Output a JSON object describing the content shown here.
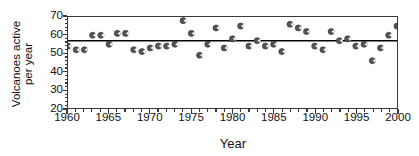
{
  "chart_data": {
    "type": "scatter",
    "title": "",
    "xlabel": "Year",
    "ylabel": "Volcanoes active\nper year",
    "xlim": [
      1960,
      2000
    ],
    "ylim": [
      20,
      70
    ],
    "xticks": [
      1960,
      1965,
      1970,
      1975,
      1980,
      1985,
      1990,
      1995,
      2000
    ],
    "xtick_labels": [
      "1960",
      "1965",
      "1970",
      "1975",
      "1980",
      "1985",
      "1990",
      "1995",
      "2000"
    ],
    "xtick_minor_step": 1,
    "yticks": [
      20,
      30,
      40,
      50,
      60,
      70
    ],
    "ytick_labels": [
      "20",
      "30",
      "40",
      "50",
      "60",
      "70"
    ],
    "ytick_minor_step": 2,
    "grid": false,
    "legend": null,
    "marker": "filled-circle",
    "marker_color": "#555555",
    "reference_line": {
      "type": "horizontal",
      "value": 57,
      "color": "#000000",
      "width": 1.6,
      "label": ""
    },
    "x": [
      1960,
      1961,
      1962,
      1963,
      1964,
      1965,
      1966,
      1967,
      1968,
      1969,
      1970,
      1971,
      1972,
      1973,
      1974,
      1975,
      1976,
      1977,
      1978,
      1979,
      1980,
      1981,
      1982,
      1983,
      1984,
      1985,
      1986,
      1987,
      1988,
      1989,
      1990,
      1991,
      1992,
      1993,
      1994,
      1995,
      1996,
      1997,
      1998,
      1999,
      2000
    ],
    "values": [
      54,
      52,
      52,
      60,
      60,
      55,
      61,
      61,
      52,
      51,
      53,
      54,
      54,
      55,
      68,
      61,
      49,
      55,
      64,
      53,
      58,
      65,
      54,
      57,
      54,
      55,
      51,
      66,
      64,
      62,
      54,
      52,
      62,
      57,
      58,
      54,
      55,
      46,
      53,
      60,
      65
    ],
    "points": [
      {
        "year": 1960,
        "value": 54
      },
      {
        "year": 1961,
        "value": 52
      },
      {
        "year": 1962,
        "value": 52
      },
      {
        "year": 1963,
        "value": 60
      },
      {
        "year": 1964,
        "value": 60
      },
      {
        "year": 1965,
        "value": 55
      },
      {
        "year": 1966,
        "value": 61
      },
      {
        "year": 1967,
        "value": 61
      },
      {
        "year": 1968,
        "value": 52
      },
      {
        "year": 1969,
        "value": 51
      },
      {
        "year": 1970,
        "value": 53
      },
      {
        "year": 1971,
        "value": 54
      },
      {
        "year": 1972,
        "value": 54
      },
      {
        "year": 1973,
        "value": 55
      },
      {
        "year": 1974,
        "value": 68
      },
      {
        "year": 1975,
        "value": 61
      },
      {
        "year": 1976,
        "value": 49
      },
      {
        "year": 1977,
        "value": 55
      },
      {
        "year": 1978,
        "value": 64
      },
      {
        "year": 1979,
        "value": 53
      },
      {
        "year": 1980,
        "value": 58
      },
      {
        "year": 1981,
        "value": 65
      },
      {
        "year": 1982,
        "value": 54
      },
      {
        "year": 1983,
        "value": 57
      },
      {
        "year": 1984,
        "value": 54
      },
      {
        "year": 1985,
        "value": 55
      },
      {
        "year": 1986,
        "value": 51
      },
      {
        "year": 1987,
        "value": 66
      },
      {
        "year": 1988,
        "value": 64
      },
      {
        "year": 1989,
        "value": 62
      },
      {
        "year": 1990,
        "value": 54
      },
      {
        "year": 1991,
        "value": 52
      },
      {
        "year": 1992,
        "value": 62
      },
      {
        "year": 1993,
        "value": 57
      },
      {
        "year": 1994,
        "value": 58
      },
      {
        "year": 1995,
        "value": 54
      },
      {
        "year": 1996,
        "value": 55
      },
      {
        "year": 1997,
        "value": 46
      },
      {
        "year": 1998,
        "value": 53
      },
      {
        "year": 1999,
        "value": 60
      },
      {
        "year": 2000,
        "value": 65
      }
    ]
  }
}
